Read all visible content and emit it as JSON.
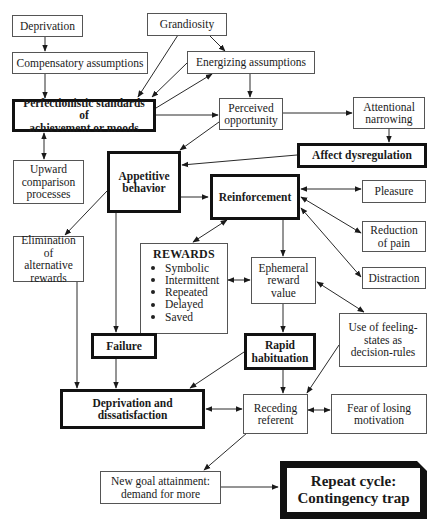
{
  "diagram": {
    "type": "flowchart",
    "nodes": {
      "deprivation": {
        "label": "Deprivation"
      },
      "grandiosity": {
        "label": "Grandiosity"
      },
      "compensatory": {
        "label": "Compensatory assumptions"
      },
      "energizing": {
        "label": "Energizing assumptions"
      },
      "perfectionistic": {
        "label": "Perfectionistic standards of\nachievement or moods"
      },
      "perceived": {
        "label": "Perceived\nopportunity"
      },
      "attentional": {
        "label": "Attentional\nnarrowing"
      },
      "affect": {
        "label": "Affect dysregulation"
      },
      "upward": {
        "label": "Upward\ncomparison\nprocesses"
      },
      "appetitive": {
        "label": "Appetitive\nbehavior"
      },
      "reinforcement": {
        "label": "Reinforcement"
      },
      "pleasure": {
        "label": "Pleasure"
      },
      "reduction": {
        "label": "Reduction\nof pain"
      },
      "distraction": {
        "label": "Distraction"
      },
      "elimination": {
        "label": "Elimination of\nalternative\nrewards"
      },
      "rewards": {
        "title": "REWARDS",
        "items": [
          "Symbolic",
          "Intermittent",
          "Repeated",
          "Delayed",
          "Saved"
        ]
      },
      "ephemeral": {
        "label": "Ephemeral\nreward\nvalue"
      },
      "feeling": {
        "label": "Use of feeling-\nstates as\ndecision-rules"
      },
      "failure": {
        "label": "Failure"
      },
      "rapid": {
        "label": "Rapid\nhabituation"
      },
      "dep_dissat": {
        "label": "Deprivation and\ndissatisfaction"
      },
      "receding": {
        "label": "Receding\nreferent"
      },
      "fear": {
        "label": "Fear of losing\nmotivation"
      },
      "newgoal": {
        "label": "New goal attainment:\ndemand for more"
      },
      "repeat": {
        "label": "Repeat cycle:\nContingency trap"
      }
    },
    "edges": [
      {
        "from": "deprivation",
        "to": "compensatory",
        "type": "arrow"
      },
      {
        "from": "compensatory",
        "to": "perfectionistic",
        "type": "arrow"
      },
      {
        "from": "grandiosity",
        "to": "perfectionistic",
        "type": "arrow"
      },
      {
        "from": "grandiosity",
        "to": "energizing",
        "type": "arrow"
      },
      {
        "from": "energizing",
        "to": "perfectionistic",
        "type": "arrow"
      },
      {
        "from": "perfectionistic",
        "to": "energizing",
        "type": "arrow"
      },
      {
        "from": "energizing",
        "to": "perceived",
        "type": "arrow"
      },
      {
        "from": "perfectionistic",
        "to": "perceived",
        "type": "arrow"
      },
      {
        "from": "perfectionistic",
        "to": "upward",
        "type": "bidirectional"
      },
      {
        "from": "perceived",
        "to": "appetitive",
        "type": "arrow"
      },
      {
        "from": "perceived",
        "to": "attentional",
        "type": "arrow"
      },
      {
        "from": "attentional",
        "to": "affect",
        "type": "arrow"
      },
      {
        "from": "affect",
        "to": "appetitive",
        "type": "arrow"
      },
      {
        "from": "appetitive",
        "to": "reinforcement",
        "type": "arrow"
      },
      {
        "from": "appetitive",
        "to": "elimination",
        "type": "arrow"
      },
      {
        "from": "appetitive",
        "to": "failure",
        "type": "arrow"
      },
      {
        "from": "reinforcement",
        "to": "pleasure",
        "type": "bidirectional"
      },
      {
        "from": "reinforcement",
        "to": "reduction",
        "type": "bidirectional"
      },
      {
        "from": "reinforcement",
        "to": "distraction",
        "type": "bidirectional"
      },
      {
        "from": "reinforcement",
        "to": "rewards",
        "type": "bidirectional"
      },
      {
        "from": "reinforcement",
        "to": "ephemeral",
        "type": "arrow"
      },
      {
        "from": "rewards",
        "to": "ephemeral",
        "type": "bidirectional"
      },
      {
        "from": "ephemeral",
        "to": "feeling",
        "type": "bidirectional"
      },
      {
        "from": "ephemeral",
        "to": "rapid",
        "type": "arrow"
      },
      {
        "from": "elimination",
        "to": "dep_dissat",
        "type": "arrow"
      },
      {
        "from": "failure",
        "to": "dep_dissat",
        "type": "arrow"
      },
      {
        "from": "rapid",
        "to": "dep_dissat",
        "type": "arrow"
      },
      {
        "from": "rapid",
        "to": "receding",
        "type": "arrow"
      },
      {
        "from": "feeling",
        "to": "receding",
        "type": "arrow"
      },
      {
        "from": "dep_dissat",
        "to": "receding",
        "type": "bidirectional"
      },
      {
        "from": "receding",
        "to": "fear",
        "type": "bidirectional"
      },
      {
        "from": "receding",
        "to": "newgoal",
        "type": "arrow"
      },
      {
        "from": "newgoal",
        "to": "repeat",
        "type": "arrow"
      }
    ]
  }
}
